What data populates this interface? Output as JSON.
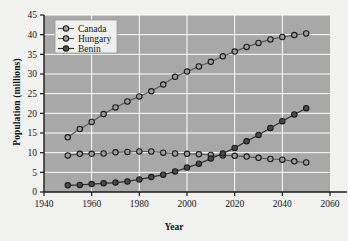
{
  "chart_data": {
    "type": "line",
    "title": "",
    "xlabel": "Year",
    "ylabel": "Population (millions)",
    "xlim": [
      1940,
      2060
    ],
    "ylim": [
      0,
      45
    ],
    "xticks": [
      1940,
      1960,
      1980,
      2000,
      2020,
      2040,
      2060
    ],
    "yticks": [
      0,
      5,
      10,
      15,
      20,
      25,
      30,
      35,
      40,
      45
    ],
    "grid": true,
    "legend_position": "top-left",
    "x": [
      1950,
      1955,
      1960,
      1965,
      1970,
      1975,
      1980,
      1985,
      1990,
      1995,
      2000,
      2005,
      2010,
      2015,
      2020,
      2025,
      2030,
      2035,
      2040,
      2045,
      2050
    ],
    "series": [
      {
        "name": "Canada",
        "marker": "open-circle",
        "color": "#8c8c8c",
        "values": [
          13.9,
          16.0,
          17.8,
          19.8,
          21.5,
          23.0,
          24.3,
          25.6,
          27.3,
          29.3,
          30.6,
          31.9,
          33.1,
          34.5,
          35.7,
          36.9,
          37.9,
          38.8,
          39.4,
          39.9,
          40.3
        ]
      },
      {
        "name": "Hungary",
        "marker": "open-circle",
        "color": "#8c8c8c",
        "values": [
          9.3,
          9.7,
          9.7,
          9.8,
          10.1,
          10.2,
          10.3,
          10.3,
          10.0,
          9.8,
          9.7,
          9.6,
          9.4,
          9.3,
          9.2,
          9.0,
          8.7,
          8.4,
          8.2,
          7.8,
          7.5
        ]
      },
      {
        "name": "Benin",
        "marker": "filled-circle",
        "color": "#2e2e2e",
        "values": [
          1.7,
          1.8,
          2.0,
          2.2,
          2.4,
          2.7,
          3.2,
          3.8,
          4.4,
          5.2,
          6.2,
          7.2,
          8.5,
          9.8,
          11.2,
          12.9,
          14.5,
          16.3,
          18.0,
          19.7,
          21.3
        ]
      }
    ]
  },
  "style": {
    "plot_bg": "#a8a8a8",
    "page_bg": "#f2f2f0",
    "grid_color": "#ffffff",
    "axis_color": "#1a1a1a",
    "legend_bg": "#f0f0ee"
  },
  "legend": {
    "items": [
      {
        "label": "Canada"
      },
      {
        "label": "Hungary"
      },
      {
        "label": "Benin"
      }
    ]
  }
}
